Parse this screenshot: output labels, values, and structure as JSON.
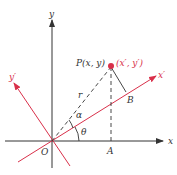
{
  "diagram": {
    "colors": {
      "axis": "#333333",
      "rotated": "#d9304a",
      "dashed": "#333333",
      "point": "#d9304a"
    },
    "labels": {
      "y_axis": "y",
      "x_axis": "x",
      "x_prime": "x′",
      "y_prime": "y′",
      "origin": "O",
      "point_p": "P(x, y)",
      "point_prime": "(x′, y′)",
      "r": "r",
      "alpha": "α",
      "theta": "θ",
      "a": "A",
      "b": "B"
    }
  }
}
